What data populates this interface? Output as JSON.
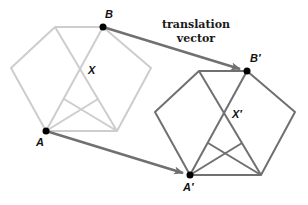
{
  "colors": {
    "original": "#cdcdcd",
    "image": "#707070",
    "arrow": "#707070",
    "point": "#000000",
    "text": "#111111"
  },
  "labels": {
    "A": "A",
    "B": "B",
    "X": "X",
    "A_prime": "A′",
    "B_prime": "B′",
    "X_prime": "X′",
    "vector_line1": "translation",
    "vector_line2": "vector"
  },
  "geometry": {
    "translation": [
      144,
      44
    ],
    "original_hexagon": [
      [
        55,
        27
      ],
      [
        103,
        27
      ],
      [
        151,
        68
      ],
      [
        117,
        131
      ],
      [
        46,
        131
      ],
      [
        11,
        68
      ]
    ],
    "image_hexagon": [
      [
        199,
        71
      ],
      [
        247,
        71
      ],
      [
        295,
        112
      ],
      [
        261,
        175
      ],
      [
        190,
        175
      ],
      [
        155,
        112
      ]
    ],
    "points": {
      "A": [
        46,
        131
      ],
      "B": [
        103,
        27
      ],
      "A_prime": [
        190,
        175
      ],
      "B_prime": [
        247,
        71
      ]
    }
  }
}
